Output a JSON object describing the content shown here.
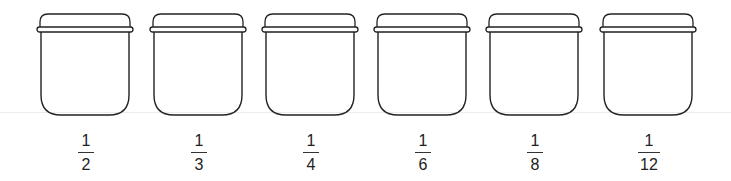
{
  "diagram": {
    "stroke_color": "#222222",
    "jars": [
      {
        "label_numerator": "1",
        "label_denominator": "2",
        "x": 36
      },
      {
        "label_numerator": "1",
        "label_denominator": "3",
        "x": 149
      },
      {
        "label_numerator": "1",
        "label_denominator": "4",
        "x": 261
      },
      {
        "label_numerator": "1",
        "label_denominator": "6",
        "x": 373
      },
      {
        "label_numerator": "1",
        "label_denominator": "8",
        "x": 485
      },
      {
        "label_numerator": "1",
        "label_denominator": "12",
        "x": 599
      }
    ]
  }
}
